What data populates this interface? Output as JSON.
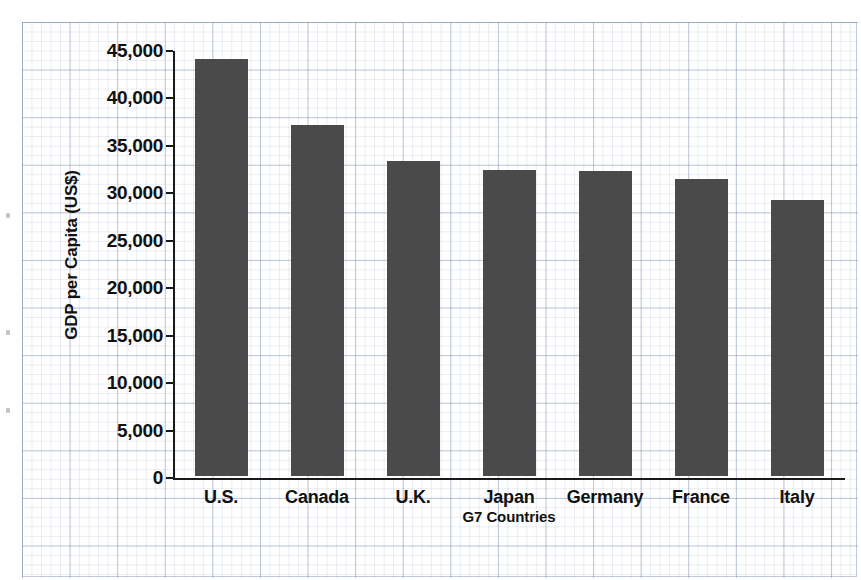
{
  "chart_data": {
    "type": "bar",
    "title": "",
    "xlabel": "G7 Countries",
    "ylabel": "GDP per Capita (US$)",
    "categories": [
      "U.S.",
      "Canada",
      "U.K.",
      "Japan",
      "Germany",
      "France",
      "Italy"
    ],
    "values": [
      44000,
      37000,
      33200,
      32300,
      32100,
      31300,
      29100
    ],
    "ylim": [
      0,
      45000
    ],
    "ytick_labels": [
      "45,000",
      "40,000",
      "35,000",
      "30,000",
      "25,000",
      "20,000",
      "15,000",
      "10,000",
      "5,000",
      "0"
    ],
    "ytick_values": [
      45000,
      40000,
      35000,
      30000,
      25000,
      20000,
      15000,
      10000,
      5000,
      0
    ],
    "grid": true,
    "legend": "none",
    "bar_color": "#4a4a4a",
    "axis_color": "#1a1a1a",
    "grid_color": "#7a8caf",
    "background": "#ffffff"
  }
}
